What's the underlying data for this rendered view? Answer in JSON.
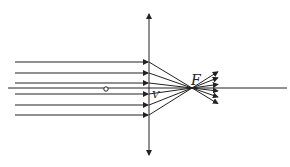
{
  "diagram": {
    "labels": {
      "focus": "F",
      "vertex": "V"
    },
    "lens": {
      "x": 149,
      "y_top": 14,
      "y_bottom": 155
    },
    "axis": {
      "y": 88,
      "x_start": 8,
      "x_end": 287
    },
    "focus_point": {
      "x": 192,
      "y": 88
    },
    "center_marker": {
      "x": 106,
      "y": 89
    },
    "ray_heights": [
      62,
      73,
      83,
      94,
      105,
      115
    ],
    "ray_start_x": 15,
    "stroke_color": "#222222"
  }
}
